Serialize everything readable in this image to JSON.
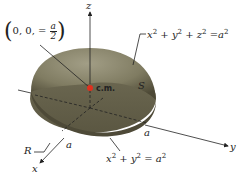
{
  "diagram": {
    "type": "hemisphere-center-of-mass",
    "axes": {
      "x": "x",
      "y": "y",
      "z": "z"
    },
    "labels": {
      "point_prefix": "0, 0, =",
      "point_num": "a",
      "point_den": "2",
      "sphere_eq_lhs_x": "x",
      "sphere_eq_lhs_y": "y",
      "sphere_eq_lhs_z": "z",
      "sphere_eq_rhs": "a",
      "exp": "2",
      "plus": "+",
      "equals": "=",
      "surface": "S",
      "region": "R",
      "radius_x": "a",
      "radius_y": "a",
      "center_of_mass": "c.m.",
      "disk_eq_x": "x",
      "disk_eq_y": "y",
      "disk_eq_rhs": "a"
    },
    "colors": {
      "hemisphere_top": "#8f8b72",
      "hemisphere_dark": "#4f4b38",
      "base": "#6e6a54",
      "center_point": "#e0301e",
      "lines": "#222222"
    }
  }
}
